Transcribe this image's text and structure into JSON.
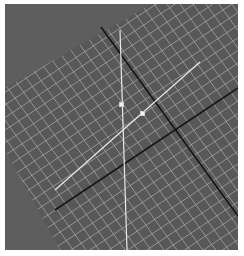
{
  "viewport": {
    "type": "3d-viewport",
    "background_color": "#5e5e5e",
    "grid_fill_color": "#585858",
    "grid_line_color": "#a8a8a8",
    "axis_line_color": "#141414",
    "edge_line_color": "#e8e8e8",
    "vertex_color": "#f2f2f2"
  },
  "scene": {
    "grid_floor": {
      "label": "grid-floor",
      "polygon": [
        [
          0,
          84
        ],
        [
          150,
          -2
        ],
        [
          240,
          -2
        ],
        [
          240,
          250
        ],
        [
          57,
          250
        ],
        [
          0,
          146
        ]
      ]
    },
    "axes": [
      {
        "name": "axis-x",
        "from": [
          96,
          23
        ],
        "to": [
          233,
          212
        ]
      },
      {
        "name": "axis-y",
        "from": [
          50,
          206
        ],
        "to": [
          233,
          84
        ]
      }
    ],
    "edges": [
      {
        "name": "edge-vertical",
        "from": [
          115,
          26
        ],
        "to": [
          122,
          246
        ]
      },
      {
        "name": "edge-diagonal",
        "from": [
          50,
          186
        ],
        "to": [
          195,
          58
        ]
      }
    ],
    "vertices": [
      {
        "name": "vertex-1",
        "x": 116,
        "y": 100
      },
      {
        "name": "vertex-2",
        "x": 137,
        "y": 109
      }
    ]
  }
}
